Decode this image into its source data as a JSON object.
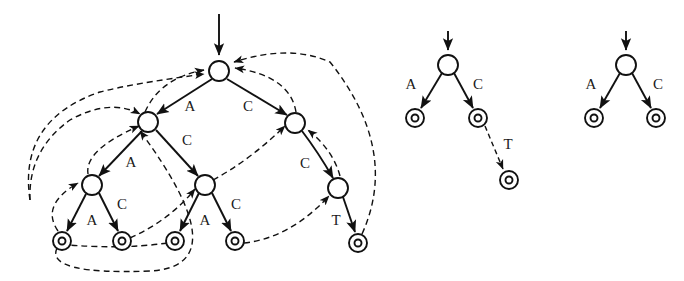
{
  "figure": {
    "title": "",
    "alphabet": [
      "A",
      "C",
      "T"
    ],
    "panels": [
      {
        "id": "panel-main",
        "name": "aho-corasick-automaton-with-failure-links"
      },
      {
        "id": "panel-mid",
        "name": "small-trie-with-one-failure-link"
      },
      {
        "id": "panel-right",
        "name": "small-trie-two-leaves"
      }
    ]
  },
  "main_tree": {
    "start_arrow": {
      "label": ""
    },
    "nodes": [
      {
        "id": "root",
        "kind": "internal",
        "cx": 219,
        "cy": 71
      },
      {
        "id": "n_A",
        "kind": "internal",
        "cx": 148,
        "cy": 122
      },
      {
        "id": "n_C",
        "kind": "internal",
        "cx": 295,
        "cy": 123
      },
      {
        "id": "n_AA",
        "kind": "internal",
        "cx": 92,
        "cy": 185
      },
      {
        "id": "n_AC",
        "kind": "internal",
        "cx": 205,
        "cy": 185
      },
      {
        "id": "n_CC",
        "kind": "internal",
        "cx": 338,
        "cy": 188
      },
      {
        "id": "n_AAA",
        "kind": "accept",
        "cx": 62,
        "cy": 241
      },
      {
        "id": "n_AAC",
        "kind": "accept",
        "cx": 122,
        "cy": 241
      },
      {
        "id": "n_ACA",
        "kind": "accept",
        "cx": 175,
        "cy": 241
      },
      {
        "id": "n_ACC",
        "kind": "accept",
        "cx": 235,
        "cy": 241
      },
      {
        "id": "n_CCT",
        "kind": "accept",
        "cx": 358,
        "cy": 243
      }
    ],
    "edges": [
      {
        "from": "root",
        "to": "n_A",
        "label": "A",
        "lx": 190,
        "ly": 108,
        "type": "solid"
      },
      {
        "from": "root",
        "to": "n_C",
        "label": "C",
        "lx": 248,
        "ly": 108,
        "type": "solid"
      },
      {
        "from": "n_A",
        "to": "n_AA",
        "label": "A",
        "lx": 131,
        "ly": 164,
        "type": "solid"
      },
      {
        "from": "n_A",
        "to": "n_AC",
        "label": "C",
        "lx": 187,
        "ly": 142,
        "type": "solid"
      },
      {
        "from": "n_AA",
        "to": "n_AAA",
        "label": "A",
        "lx": 92,
        "ly": 222,
        "type": "solid"
      },
      {
        "from": "n_AA",
        "to": "n_AAC",
        "label": "C",
        "lx": 122,
        "ly": 206,
        "type": "solid"
      },
      {
        "from": "n_AC",
        "to": "n_ACA",
        "label": "A",
        "lx": 205,
        "ly": 222,
        "type": "solid"
      },
      {
        "from": "n_AC",
        "to": "n_ACC",
        "label": "C",
        "lx": 236,
        "ly": 206,
        "type": "solid"
      },
      {
        "from": "n_C",
        "to": "n_CC",
        "label": "C",
        "lx": 305,
        "ly": 165,
        "type": "solid"
      },
      {
        "from": "n_CC",
        "to": "n_CCT",
        "label": "T",
        "lx": 336,
        "ly": 222,
        "type": "solid"
      }
    ],
    "failure_links": [
      {
        "from": "n_A",
        "to": "root",
        "label": ""
      },
      {
        "from": "n_C",
        "to": "root",
        "label": ""
      },
      {
        "from": "n_CC",
        "to": "n_C",
        "label": ""
      },
      {
        "from": "n_AA",
        "to": "n_A",
        "label": ""
      },
      {
        "from": "n_AC",
        "to": "n_C",
        "label": ""
      },
      {
        "from": "n_AAA",
        "to": "n_AA",
        "label": ""
      },
      {
        "from": "n_AAC",
        "to": "n_AC",
        "label": ""
      },
      {
        "from": "n_ACA",
        "to": "n_A",
        "label": ""
      },
      {
        "from": "n_ACC",
        "to": "n_CC",
        "label": ""
      },
      {
        "from": "n_CCT",
        "to": "root",
        "label": ""
      }
    ]
  },
  "mid_tree": {
    "nodes": [
      {
        "id": "m_root",
        "kind": "internal",
        "cx": 448,
        "cy": 65
      },
      {
        "id": "m_A",
        "kind": "accept",
        "cx": 415,
        "cy": 118
      },
      {
        "id": "m_C",
        "kind": "accept",
        "cx": 478,
        "cy": 118
      },
      {
        "id": "m_T",
        "kind": "accept",
        "cx": 509,
        "cy": 180
      }
    ],
    "edges": [
      {
        "from": "m_root",
        "to": "m_A",
        "label": "A",
        "lx": 411,
        "ly": 86,
        "type": "solid"
      },
      {
        "from": "m_root",
        "to": "m_C",
        "label": "C",
        "lx": 478,
        "ly": 86,
        "type": "solid"
      },
      {
        "from": "m_C",
        "to": "m_T",
        "label": "T",
        "lx": 508,
        "ly": 146,
        "type": "dashed"
      }
    ]
  },
  "right_tree": {
    "nodes": [
      {
        "id": "r_root",
        "kind": "internal",
        "cx": 626,
        "cy": 65
      },
      {
        "id": "r_A",
        "kind": "accept",
        "cx": 594,
        "cy": 118
      },
      {
        "id": "r_C",
        "kind": "accept",
        "cx": 656,
        "cy": 118
      }
    ],
    "edges": [
      {
        "from": "r_root",
        "to": "r_A",
        "label": "A",
        "lx": 591,
        "ly": 86,
        "type": "solid"
      },
      {
        "from": "r_root",
        "to": "r_C",
        "label": "C",
        "lx": 658,
        "ly": 86,
        "type": "solid"
      }
    ]
  },
  "style": {
    "ink": "#111111",
    "background": "#ffffff",
    "node_radius": 10,
    "accept_outer_radius": 9,
    "accept_inner_radius": 3.5,
    "solid_width": 1.9,
    "dashed_width": 1.4,
    "dash_pattern": "6 4"
  },
  "labels": {
    "main_A1": "A",
    "main_C1": "C",
    "main_C2": "C",
    "main_A2": "A",
    "main_A3": "A",
    "main_C3": "C",
    "main_A4": "A",
    "main_C4": "C",
    "main_C5": "C",
    "main_T1": "T",
    "mid_A": "A",
    "mid_C": "C",
    "mid_T": "T",
    "right_A": "A",
    "right_C": "C"
  }
}
